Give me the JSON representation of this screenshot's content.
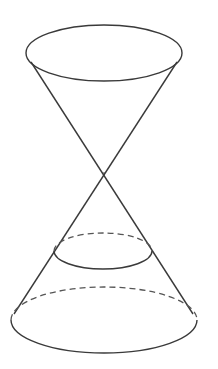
{
  "diagram": {
    "title": "",
    "colors": {
      "background": "#ffffff",
      "stroke": "#3a3a3a",
      "hidden_stroke": "#555555"
    },
    "shapes": {
      "upper_rim": {
        "cx": 104,
        "cy": 53,
        "rx": 78,
        "ry": 28,
        "style": "solid"
      },
      "apex": {
        "x": 104,
        "y": 173
      },
      "generator_lines": [
        {
          "x1": 31,
          "y1": 62,
          "x2": 193,
          "y2": 314
        },
        {
          "x1": 177,
          "y1": 62,
          "x2": 14,
          "y2": 314
        }
      ],
      "cross_section": {
        "cx": 103,
        "cy": 251,
        "rx": 49,
        "ry": 18,
        "front": "solid",
        "back": "dashed"
      },
      "lower_base": {
        "cx": 104,
        "cy": 320,
        "rx": 93,
        "ry": 33,
        "front": "solid",
        "back": "dashed"
      }
    },
    "labels": []
  }
}
